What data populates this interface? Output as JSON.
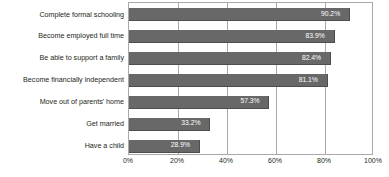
{
  "chart_data": {
    "type": "bar",
    "orientation": "horizontal",
    "title": "",
    "subtitle": "",
    "xlabel": "",
    "ylabel": "",
    "categories": [
      "Complete formal schooling",
      "Become employed full time",
      "Be able to support a family",
      "Become financially independent",
      "Move out of parents' home",
      "Get married",
      "Have a child"
    ],
    "values": [
      90.2,
      83.9,
      82.4,
      81.1,
      57.3,
      33.2,
      28.9
    ],
    "value_labels": [
      "90.2%",
      "83.9%",
      "82.4%",
      "81.1%",
      "57.3%",
      "33.2%",
      "28.9%"
    ],
    "xlim": [
      0,
      100
    ],
    "xticks": [
      0,
      20,
      40,
      60,
      80,
      100
    ],
    "xtick_labels": [
      "0%",
      "20%",
      "40%",
      "60%",
      "80%",
      "100%"
    ],
    "grid": true,
    "legend": "none",
    "series_color": "#686868",
    "value_label_color": "#ffffff",
    "axis_color": "#a9a9a9",
    "text_color": "#231f20",
    "background": "#ffffff"
  }
}
